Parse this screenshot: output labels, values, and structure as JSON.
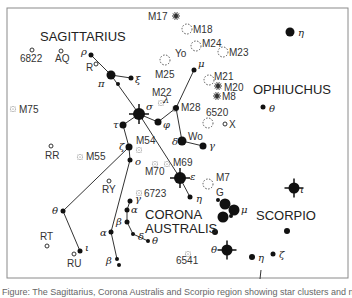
{
  "constellations": [
    {
      "name": "SAGITTARIUS",
      "x": 40,
      "y": 41
    },
    {
      "name": "OPHIUCHUS",
      "x": 253,
      "y": 94
    },
    {
      "name": "CORONA",
      "x": 145,
      "y": 219
    },
    {
      "name": "AUSTRALIS",
      "x": 145,
      "y": 233
    },
    {
      "name": "SCORPIO",
      "x": 256,
      "y": 220
    }
  ],
  "stars": [
    {
      "id": "rho-sgr",
      "greek": "ρ",
      "x": 91,
      "y": 55,
      "r": 2.5,
      "lx": 81,
      "ly": 55
    },
    {
      "id": "pi-sgr",
      "greek": "π",
      "x": 111,
      "y": 75,
      "r": 4.5,
      "lx": 98,
      "ly": 87
    },
    {
      "id": "xi-sgr",
      "greek": "ξ",
      "x": 131,
      "y": 78,
      "r": 2.5,
      "lx": 135,
      "ly": 83
    },
    {
      "id": "omicron-mid",
      "greek": "",
      "x": 118,
      "y": 84,
      "r": 2,
      "lx": 0,
      "ly": 0
    },
    {
      "id": "sigma-sgr",
      "greek": "σ",
      "x": 139,
      "y": 114,
      "r": 6,
      "lx": 146,
      "ly": 110,
      "spiky": true
    },
    {
      "id": "phi-sgr",
      "greek": "φ",
      "x": 158,
      "y": 122,
      "r": 3.5,
      "lx": 163,
      "ly": 128
    },
    {
      "id": "lambda-sgr",
      "greek": "λ",
      "x": 176,
      "y": 108,
      "r": 3,
      "lx": 163,
      "ly": 103
    },
    {
      "id": "mu-sgr",
      "greek": "μ",
      "x": 194,
      "y": 70,
      "r": 2.5,
      "lx": 198,
      "ly": 67
    },
    {
      "id": "tau-sgr",
      "greek": "τ",
      "x": 123,
      "y": 125,
      "r": 3.5,
      "lx": 113,
      "ly": 128
    },
    {
      "id": "zeta-sgr",
      "greek": "ζ",
      "x": 129,
      "y": 147,
      "r": 3.5,
      "lx": 119,
      "ly": 150
    },
    {
      "id": "omicron-sgr",
      "greek": "o",
      "x": 130,
      "y": 160,
      "r": 2.5,
      "lx": 135,
      "ly": 165
    },
    {
      "id": "delta-sgr",
      "greek": "δ",
      "x": 182,
      "y": 141,
      "r": 4.5,
      "lx": 172,
      "ly": 145
    },
    {
      "id": "gamma-sgr",
      "greek": "γ",
      "x": 203,
      "y": 146,
      "r": 3.5,
      "lx": 209,
      "ly": 149
    },
    {
      "id": "epsilon-sgr",
      "greek": "ε",
      "x": 180,
      "y": 178,
      "r": 6,
      "lx": 190,
      "ly": 180,
      "spiky": true
    },
    {
      "id": "eta-sgr",
      "greek": "η",
      "x": 190,
      "y": 197,
      "r": 2.5,
      "lx": 196,
      "ly": 202
    },
    {
      "id": "theta-sgr",
      "greek": "θ",
      "x": 63,
      "y": 211,
      "r": 2.5,
      "lx": 52,
      "ly": 214
    },
    {
      "id": "iota-sgr",
      "greek": "ι",
      "x": 80,
      "y": 251,
      "r": 2.5,
      "lx": 85,
      "ly": 251
    },
    {
      "id": "alpha-sgr",
      "greek": "α",
      "x": 111,
      "y": 232,
      "r": 2.5,
      "lx": 100,
      "ly": 236
    },
    {
      "id": "beta1-sgr",
      "greek": "β",
      "x": 117,
      "y": 259,
      "r": 2,
      "lx": 106,
      "ly": 264
    },
    {
      "id": "beta2-sgr",
      "greek": "",
      "x": 119,
      "y": 265,
      "r": 2,
      "lx": 0,
      "ly": 0
    },
    {
      "id": "gamma-cra",
      "greek": "γ",
      "x": 130,
      "y": 201,
      "r": 2.5,
      "lx": 135,
      "ly": 202
    },
    {
      "id": "alpha-cra",
      "greek": "α",
      "x": 127,
      "y": 210,
      "r": 2.5,
      "lx": 131,
      "ly": 213
    },
    {
      "id": "beta-cra",
      "greek": "β",
      "x": 127,
      "y": 222,
      "r": 2.5,
      "lx": 116,
      "ly": 225
    },
    {
      "id": "delta-cra",
      "greek": "δ",
      "x": 133,
      "y": 234,
      "r": 2,
      "lx": 138,
      "ly": 240
    },
    {
      "id": "theta-cra",
      "greek": "θ",
      "x": 148,
      "y": 241,
      "r": 2,
      "lx": 152,
      "ly": 244
    },
    {
      "id": "eta-oph",
      "greek": "η",
      "x": 290,
      "y": 32,
      "r": 4.5,
      "lx": 298,
      "ly": 36
    },
    {
      "id": "theta-oph",
      "greek": "θ",
      "x": 263,
      "y": 107,
      "r": 2.5,
      "lx": 269,
      "ly": 112
    },
    {
      "id": "G-sco-a",
      "greek": "",
      "x": 218,
      "y": 200,
      "r": 2,
      "lx": 0,
      "ly": 0
    },
    {
      "id": "G-sco-b",
      "greek": "",
      "x": 225,
      "y": 204,
      "r": 5.5,
      "lx": 0,
      "ly": 0
    },
    {
      "id": "mu-sco",
      "greek": "μ",
      "x": 234,
      "y": 210,
      "r": 5.5,
      "lx": 241,
      "ly": 213
    },
    {
      "id": "zeta-sco-b",
      "greek": "",
      "x": 223,
      "y": 217,
      "r": 5.5,
      "lx": 0,
      "ly": 0
    },
    {
      "id": "zeta-sco-c",
      "greek": "",
      "x": 231,
      "y": 216,
      "r": 2,
      "lx": 0,
      "ly": 0
    },
    {
      "id": "kappa-sco",
      "greek": "",
      "x": 215,
      "y": 232,
      "r": 3,
      "lx": 0,
      "ly": 0
    },
    {
      "id": "theta-sco",
      "greek": "θ",
      "x": 227,
      "y": 250,
      "r": 5.5,
      "lx": 211,
      "ly": 253,
      "spiky": true
    },
    {
      "id": "eta-sco",
      "greek": "η",
      "x": 252,
      "y": 257,
      "r": 3,
      "lx": 258,
      "ly": 261
    },
    {
      "id": "zeta-sco",
      "greek": "ζ",
      "x": 273,
      "y": 254,
      "r": 2.5,
      "lx": 279,
      "ly": 258
    },
    {
      "id": "lambda-sco",
      "greek": "",
      "x": 287,
      "y": 231,
      "r": 3,
      "lx": 0,
      "ly": 0
    },
    {
      "id": "iota-sco",
      "greek": "ι",
      "x": 294,
      "y": 188,
      "r": 5.5,
      "lx": 300,
      "ly": 193,
      "spiky": true
    }
  ],
  "lines": [
    [
      "rho-sgr",
      "pi-sgr"
    ],
    [
      "pi-sgr",
      "xi-sgr"
    ],
    [
      "pi-sgr",
      "sigma-sgr"
    ],
    [
      "sigma-sgr",
      "phi-sgr"
    ],
    [
      "phi-sgr",
      "lambda-sgr"
    ],
    [
      "lambda-sgr",
      "mu-sgr"
    ],
    [
      "lambda-sgr",
      "delta-sgr"
    ],
    [
      "delta-sgr",
      "gamma-sgr"
    ],
    [
      "sigma-sgr",
      "tau-sgr"
    ],
    [
      "tau-sgr",
      "zeta-sgr"
    ],
    [
      "sigma-sgr",
      "epsilon-sgr"
    ],
    [
      "epsilon-sgr",
      "eta-sgr"
    ],
    [
      "zeta-sgr",
      "omicron-sgr"
    ],
    [
      "omicron-sgr",
      "alpha-sgr"
    ],
    [
      "zeta-sgr",
      "theta-sgr"
    ],
    [
      "theta-sgr",
      "iota-sgr"
    ],
    [
      "alpha-sgr",
      "beta1-sgr"
    ],
    [
      "gamma-cra",
      "alpha-cra"
    ],
    [
      "alpha-cra",
      "beta-cra"
    ],
    [
      "beta-cra",
      "delta-cra"
    ],
    [
      "delta-cra",
      "theta-cra"
    ]
  ],
  "objects": [
    {
      "label": "M17",
      "type": "nebula",
      "x": 176,
      "y": 16,
      "lx": 148,
      "ly": 20
    },
    {
      "label": "M18",
      "type": "open-cluster",
      "x": 187,
      "y": 29,
      "lx": 193,
      "ly": 33
    },
    {
      "label": "M24",
      "type": "open-cluster",
      "x": 196,
      "y": 46,
      "lx": 202,
      "ly": 47
    },
    {
      "label": "Yo",
      "type": "label",
      "x": 0,
      "y": 0,
      "lx": 175,
      "ly": 57
    },
    {
      "label": "M23",
      "type": "open-cluster",
      "x": 223,
      "y": 52,
      "lx": 229,
      "ly": 56
    },
    {
      "label": "M25",
      "type": "open-cluster",
      "x": 165,
      "y": 60,
      "lx": 155,
      "ly": 78
    },
    {
      "label": "M21",
      "type": "open-cluster",
      "x": 209,
      "y": 80,
      "lx": 214,
      "ly": 80
    },
    {
      "label": "M20",
      "type": "nebula",
      "x": 218,
      "y": 86,
      "lx": 224,
      "ly": 91
    },
    {
      "label": "M8",
      "type": "nebula",
      "x": 217,
      "y": 96,
      "lx": 222,
      "ly": 100
    },
    {
      "label": "M22",
      "type": "globular",
      "x": 161,
      "y": 103,
      "lx": 152,
      "ly": 96
    },
    {
      "label": "M28",
      "type": "globular",
      "x": 175,
      "y": 109,
      "lx": 181,
      "ly": 111
    },
    {
      "label": "6520",
      "type": "label",
      "x": 0,
      "y": 0,
      "lx": 206,
      "ly": 116
    },
    {
      "label": "",
      "type": "open-cluster",
      "x": 208,
      "y": 123,
      "lx": 0,
      "ly": 0
    },
    {
      "label": "X",
      "type": "variable",
      "x": 225,
      "y": 124,
      "lx": 229,
      "ly": 128
    },
    {
      "label": "Wo",
      "type": "label",
      "x": 0,
      "y": 0,
      "lx": 188,
      "ly": 140
    },
    {
      "label": "M54",
      "type": "globular",
      "x": 139,
      "y": 150,
      "lx": 136,
      "ly": 144
    },
    {
      "label": "M69",
      "type": "globular",
      "x": 167,
      "y": 164,
      "lx": 173,
      "ly": 166
    },
    {
      "label": "M70",
      "type": "globular",
      "x": 155,
      "y": 164,
      "lx": 145,
      "ly": 175
    },
    {
      "label": "M75",
      "type": "globular",
      "x": 13,
      "y": 109,
      "lx": 19,
      "ly": 113
    },
    {
      "label": "M55",
      "type": "globular",
      "x": 80,
      "y": 157,
      "lx": 86,
      "ly": 160
    },
    {
      "label": "6723",
      "type": "globular",
      "x": 139,
      "y": 193,
      "lx": 144,
      "ly": 197
    },
    {
      "label": "M7",
      "type": "open-cluster",
      "x": 208,
      "y": 184,
      "lx": 216,
      "ly": 181
    },
    {
      "label": "G",
      "type": "label",
      "x": 0,
      "y": 0,
      "lx": 216,
      "ly": 196
    },
    {
      "label": "6541",
      "type": "globular",
      "x": 188,
      "y": 254,
      "lx": 176,
      "ly": 264
    },
    {
      "label": "6822",
      "type": "variable",
      "x": 32,
      "y": 50,
      "lx": 20,
      "ly": 62
    },
    {
      "label": "AQ",
      "type": "variable",
      "x": 61,
      "y": 51,
      "lx": 55,
      "ly": 62
    },
    {
      "label": "R",
      "type": "variable",
      "x": 96,
      "y": 64,
      "lx": 86,
      "ly": 71
    },
    {
      "label": "RR",
      "type": "variable",
      "x": 51,
      "y": 146,
      "lx": 45,
      "ly": 159
    },
    {
      "label": "RY",
      "type": "variable",
      "x": 109,
      "y": 181,
      "lx": 102,
      "ly": 193
    },
    {
      "label": "RT",
      "type": "variable",
      "x": 47,
      "y": 246,
      "lx": 40,
      "ly": 240
    },
    {
      "label": "RU",
      "type": "variable",
      "x": 74,
      "y": 254,
      "lx": 67,
      "ly": 267
    }
  ],
  "caption": "Figure: The Sagittarius, Corona Australis and Scorpio region showing star clusters and nebulae"
}
